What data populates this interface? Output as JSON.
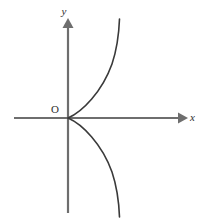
{
  "figure": {
    "background_color": "#ffffff",
    "axis_color": "#6e6e6e",
    "curve_color": "#3a3a3a",
    "label_color": "#2e2e2e",
    "axis_stroke_width": 2.2,
    "curve_stroke_width": 1.6
  },
  "labels": {
    "y_axis": "y",
    "x_axis": "x",
    "origin": "O"
  },
  "geometry": {
    "origin": {
      "x": 68,
      "y": 118
    },
    "x_axis": {
      "x1": 14,
      "y1": 118,
      "x2": 178,
      "y2": 118
    },
    "y_axis": {
      "x1": 68,
      "y1": 22,
      "x2": 68,
      "y2": 213
    },
    "x_arrow_points": "178,112.5 188,118 178,123.5",
    "y_arrow_points": "62.5,28 68,18 73.5,28",
    "y_label_pos": {
      "x": 64,
      "y": 15
    },
    "x_label_pos": {
      "x": 190,
      "y": 121
    },
    "origin_label_pos": {
      "x": 55,
      "y": 113
    },
    "upper_branch_path": "M 68 118 C 82 112 102 92 112 64 C 117 49 119 32 119.5 19",
    "lower_branch_path": "M 68 118 C 82 124 102 144 112 172 C 117 187 119 204 119.5 217"
  },
  "chart_data": {
    "type": "line",
    "title": "",
    "xlabel": "x",
    "ylabel": "y",
    "grid": false,
    "legend": false,
    "annotations": [
      "O"
    ],
    "equation": "y^2 = kx",
    "series": [
      {
        "name": "upper-branch",
        "points": [
          {
            "x": 0,
            "y": 0
          },
          {
            "x": 0.14,
            "y": 0.06
          },
          {
            "x": 0.43,
            "y": 0.27
          },
          {
            "x": 0.86,
            "y": 0.56
          },
          {
            "x": 1.0,
            "y": 1.03
          }
        ]
      },
      {
        "name": "lower-branch",
        "points": [
          {
            "x": 0,
            "y": 0
          },
          {
            "x": 0.14,
            "y": -0.06
          },
          {
            "x": 0.43,
            "y": -0.27
          },
          {
            "x": 0.86,
            "y": -0.56
          },
          {
            "x": 1.0,
            "y": -1.03
          }
        ]
      }
    ],
    "axis_ranges": {
      "x": [
        -0.5,
        1.2
      ],
      "y": [
        -1.05,
        1.05
      ]
    }
  }
}
